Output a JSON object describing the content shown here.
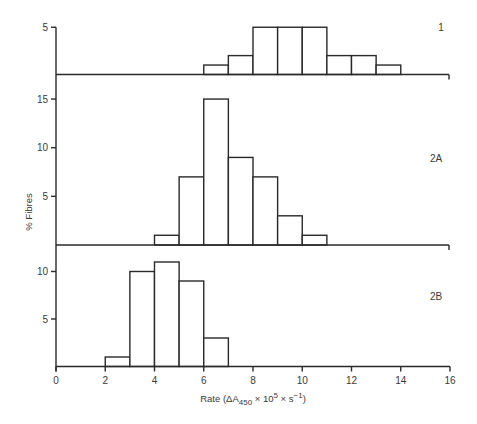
{
  "chart_data": {
    "type": "bar",
    "subtype": "stacked-panel-histogram",
    "xlabel": {
      "main": "Rate (ΔA",
      "sub": "450",
      "middle": " × 10",
      "sup1": "5",
      "tail": " × s",
      "sup2": "−1",
      "end": ")"
    },
    "ylabel": "% Fibres",
    "xlim": [
      0,
      16
    ],
    "xticks": [
      0,
      2,
      4,
      6,
      8,
      10,
      12,
      14,
      16
    ],
    "grid": false,
    "panels": [
      {
        "label": "1",
        "ylim": [
          0,
          5
        ],
        "yticks": [
          5
        ],
        "bins": [
          {
            "from": 6,
            "to": 7,
            "value": 1
          },
          {
            "from": 7,
            "to": 8,
            "value": 2
          },
          {
            "from": 8,
            "to": 9,
            "value": 5
          },
          {
            "from": 9,
            "to": 10,
            "value": 5
          },
          {
            "from": 10,
            "to": 11,
            "value": 5
          },
          {
            "from": 11,
            "to": 12,
            "value": 2
          },
          {
            "from": 12,
            "to": 13,
            "value": 2
          },
          {
            "from": 13,
            "to": 14,
            "value": 1
          }
        ]
      },
      {
        "label": "2A",
        "ylim": [
          0,
          15
        ],
        "yticks": [
          5,
          10,
          15
        ],
        "bins": [
          {
            "from": 4,
            "to": 5,
            "value": 1
          },
          {
            "from": 5,
            "to": 6,
            "value": 7
          },
          {
            "from": 6,
            "to": 7,
            "value": 15
          },
          {
            "from": 7,
            "to": 8,
            "value": 9
          },
          {
            "from": 8,
            "to": 9,
            "value": 7
          },
          {
            "from": 9,
            "to": 10,
            "value": 3
          },
          {
            "from": 10,
            "to": 11,
            "value": 1
          }
        ]
      },
      {
        "label": "2B",
        "ylim": [
          0,
          11
        ],
        "yticks": [
          5,
          10
        ],
        "bins": [
          {
            "from": 2,
            "to": 3,
            "value": 1
          },
          {
            "from": 3,
            "to": 4,
            "value": 10
          },
          {
            "from": 4,
            "to": 5,
            "value": 11
          },
          {
            "from": 5,
            "to": 6,
            "value": 9
          },
          {
            "from": 6,
            "to": 7,
            "value": 3
          }
        ]
      }
    ]
  }
}
